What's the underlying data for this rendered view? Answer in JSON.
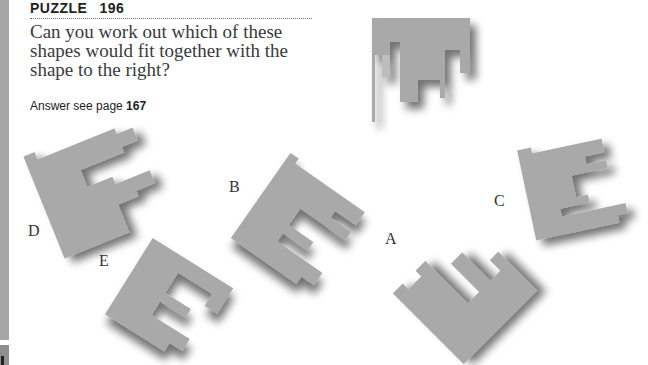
{
  "puzzle": {
    "header_label": "PUZZLE",
    "number": "196",
    "question": "Can you work out which of these shapes would fit together with the shape to the right?",
    "answer_prefix": "Answer see page",
    "answer_page": "167"
  },
  "target_shape": {
    "name": "reference-shape",
    "color": "#a9a9a9"
  },
  "options": [
    {
      "label": "A"
    },
    {
      "label": "B"
    },
    {
      "label": "C"
    },
    {
      "label": "D"
    },
    {
      "label": "E"
    }
  ],
  "colors": {
    "shape_fill": "#a9a9a9",
    "shadow": "#5a5a5a",
    "text": "#333333",
    "side_bar": "#a6a6a6"
  }
}
